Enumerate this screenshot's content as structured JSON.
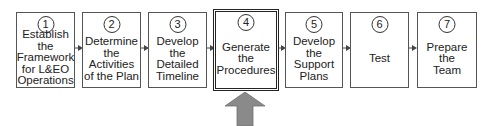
{
  "diagram": {
    "steps": [
      {
        "num": "1",
        "label": "Establish\nthe\nFramework\nfor L&EO\nOperations",
        "highlighted": false
      },
      {
        "num": "2",
        "label": "Determine\nthe\nActivities\nof the Plan",
        "highlighted": false
      },
      {
        "num": "3",
        "label": "Develop\nthe\nDetailed\nTimeline",
        "highlighted": false
      },
      {
        "num": "4",
        "label": "Generate\nthe\nProcedures",
        "highlighted": true
      },
      {
        "num": "5",
        "label": "Develop\nthe\nSupport\nPlans",
        "highlighted": false
      },
      {
        "num": "6",
        "label": "Test",
        "highlighted": false
      },
      {
        "num": "7",
        "label": "Prepare\nthe\nTeam",
        "highlighted": false
      }
    ],
    "indicator": {
      "icon": "up-arrow-icon",
      "points_to_step": "4",
      "color": "#8a8a8a"
    },
    "colors": {
      "border": "#555555",
      "text": "#222222",
      "connector": "#444444"
    }
  }
}
